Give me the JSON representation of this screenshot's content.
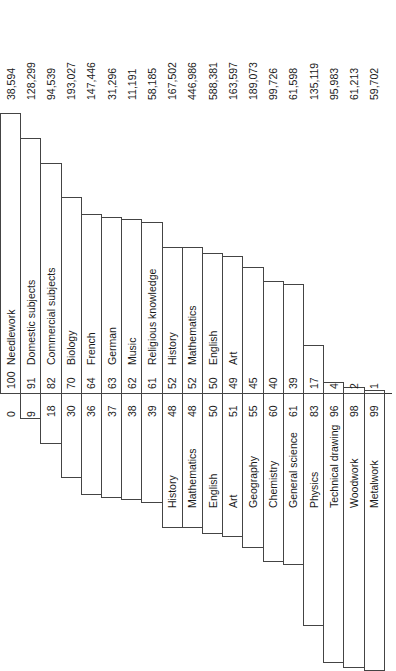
{
  "chart_data": {
    "type": "bar",
    "orientation": "rotated-90",
    "title": "",
    "categories": [
      "Needlework",
      "Domestic subjects",
      "Commercial subjects",
      "Biology",
      "French",
      "German",
      "Music",
      "Religious knowledge",
      "History",
      "Mathematics",
      "English",
      "Art",
      "Geography",
      "Chemistry",
      "General science",
      "Physics",
      "Technical drawing",
      "Woodwork",
      "Metalwork"
    ],
    "series": [
      {
        "name": "Girls %",
        "values": [
          100,
          91,
          82,
          70,
          64,
          63,
          62,
          61,
          52,
          52,
          50,
          49,
          45,
          40,
          39,
          17,
          4,
          2,
          1
        ]
      },
      {
        "name": "Boys %",
        "values": [
          0,
          9,
          18,
          30,
          36,
          37,
          38,
          39,
          48,
          48,
          50,
          51,
          55,
          60,
          61,
          83,
          96,
          98,
          99
        ]
      },
      {
        "name": "Total entries",
        "values": [
          "38,594",
          "128,299",
          "94,539",
          "193,027",
          "147,446",
          "31,296",
          "11,191",
          "58,185",
          "167,502",
          "446,986",
          "588,381",
          "163,597",
          "189,073",
          "99,726",
          "61,598",
          "135,119",
          "95,983",
          "61,213",
          "59,702"
        ]
      }
    ],
    "xlabel": "",
    "ylabel": "",
    "ylim": [
      0,
      100
    ],
    "grid": false,
    "legend": "none"
  },
  "layout": {
    "axis_y": 393,
    "col_width": 20.2,
    "px_per_pct": 2.8,
    "label_side": {
      "girls_label_on_girl_bar": [
        0,
        1,
        2,
        3,
        4,
        5,
        6,
        7,
        8,
        9,
        10,
        11
      ],
      "boys_label_on_boy_bar": [
        8,
        9,
        10,
        11,
        12,
        13,
        14,
        15,
        16,
        17,
        18
      ]
    }
  }
}
